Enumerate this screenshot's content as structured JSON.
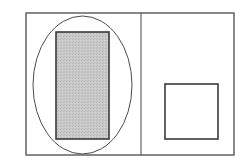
{
  "diagram": {
    "width": 241,
    "height": 161,
    "background": "#ffffff",
    "stroke_color": "#4a4a4a",
    "frame": {
      "x": 26,
      "y": 13,
      "width": 208,
      "height": 142,
      "stroke_width": 1.3
    },
    "divider": {
      "x": 141,
      "y1": 13,
      "y2": 155,
      "stroke_width": 1
    },
    "left_panel": {
      "ellipse": {
        "cx": 82.5,
        "cy": 85,
        "rx": 49.5,
        "ry": 69,
        "stroke_width": 1
      },
      "filled_rect": {
        "x": 56,
        "y": 32,
        "width": 53,
        "height": 107,
        "fill": "#c6c6c6",
        "stroke_width": 1.6
      }
    },
    "right_panel": {
      "square": {
        "x": 165,
        "y": 84,
        "width": 53,
        "height": 55,
        "fill": "#ffffff",
        "stroke_width": 1.6
      }
    }
  }
}
